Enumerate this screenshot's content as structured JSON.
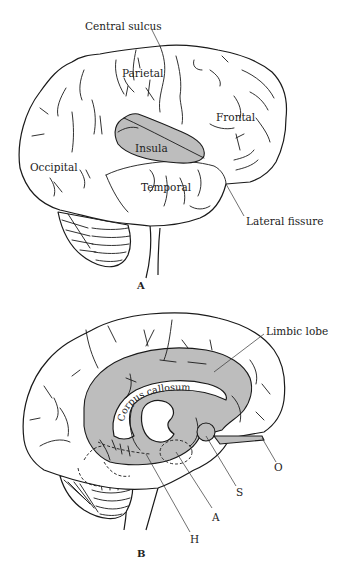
{
  "figure_a": {
    "panel_label": "A",
    "view": "lateral",
    "labels": {
      "central_sulcus": "Central sulcus",
      "parietal": "Parietal",
      "frontal": "Frontal",
      "insula": "Insula",
      "occipital": "Occipital",
      "temporal": "Temporal",
      "lateral_fissure": "Lateral fissure"
    }
  },
  "figure_b": {
    "panel_label": "B",
    "view": "medial",
    "labels": {
      "limbic_lobe": "Limbic lobe",
      "corpus_callosum": "Corpus callosum",
      "o": "O",
      "s": "S",
      "a": "A",
      "h": "H"
    }
  },
  "colors": {
    "shaded_region": "#bdbdbd",
    "line": "#1a1a1a",
    "background": "#ffffff"
  }
}
